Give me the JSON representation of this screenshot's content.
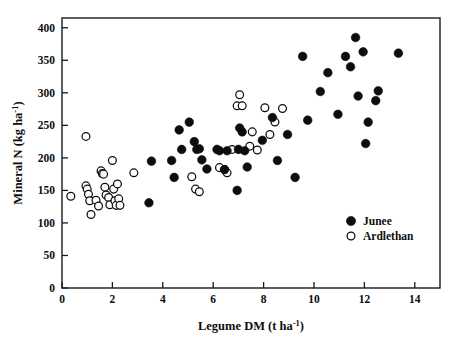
{
  "chart_data": {
    "type": "scatter",
    "title": "",
    "xlabel": "Legume DM (t ha-1)",
    "xlabel_main": "Legume DM (t ha",
    "xlabel_sup": "-1",
    "xlabel_tail": ")",
    "ylabel": "Mineral N (kg ha-1)",
    "ylabel_main": "Mineral N (kg ha",
    "ylabel_sup": "-1",
    "ylabel_tail": ")",
    "xlim": [
      0,
      15
    ],
    "ylim": [
      0,
      415
    ],
    "xticks": [
      0,
      2,
      4,
      6,
      8,
      10,
      12,
      14
    ],
    "yticks": [
      0,
      50,
      100,
      150,
      200,
      250,
      300,
      350,
      400
    ],
    "grid": false,
    "legend_position": "bottom-right",
    "marker_color": "#0d0d0d",
    "series": [
      {
        "name": "Junee",
        "marker": "filled-circle",
        "color": "#0d0d0d",
        "points": [
          [
            3.45,
            131
          ],
          [
            3.55,
            195
          ],
          [
            4.35,
            196
          ],
          [
            4.45,
            170
          ],
          [
            4.65,
            243
          ],
          [
            4.75,
            213
          ],
          [
            5.05,
            255
          ],
          [
            5.25,
            225
          ],
          [
            5.35,
            213
          ],
          [
            5.45,
            214
          ],
          [
            5.55,
            197
          ],
          [
            5.75,
            183
          ],
          [
            6.15,
            213
          ],
          [
            6.25,
            211
          ],
          [
            6.45,
            182
          ],
          [
            6.55,
            211
          ],
          [
            6.95,
            150
          ],
          [
            7.0,
            213
          ],
          [
            7.05,
            246
          ],
          [
            7.15,
            240
          ],
          [
            7.25,
            211
          ],
          [
            7.35,
            186
          ],
          [
            7.95,
            227
          ],
          [
            8.35,
            262
          ],
          [
            8.55,
            196
          ],
          [
            8.95,
            236
          ],
          [
            9.25,
            170
          ],
          [
            9.55,
            356
          ],
          [
            9.75,
            258
          ],
          [
            10.25,
            302
          ],
          [
            10.55,
            331
          ],
          [
            10.95,
            267
          ],
          [
            11.25,
            356
          ],
          [
            11.45,
            340
          ],
          [
            11.65,
            385
          ],
          [
            11.75,
            295
          ],
          [
            11.95,
            363
          ],
          [
            12.05,
            222
          ],
          [
            12.15,
            255
          ],
          [
            12.45,
            288
          ],
          [
            12.55,
            303
          ],
          [
            13.35,
            361
          ]
        ]
      },
      {
        "name": "Ardlethan",
        "marker": "open-circle",
        "color": "#0d0d0d",
        "points": [
          [
            0.35,
            141
          ],
          [
            0.95,
            233
          ],
          [
            0.95,
            157
          ],
          [
            1.0,
            152
          ],
          [
            1.05,
            144
          ],
          [
            1.1,
            134
          ],
          [
            1.15,
            113
          ],
          [
            1.35,
            135
          ],
          [
            1.45,
            126
          ],
          [
            1.55,
            180
          ],
          [
            1.6,
            176
          ],
          [
            1.65,
            175
          ],
          [
            1.7,
            155
          ],
          [
            1.75,
            143
          ],
          [
            1.85,
            139
          ],
          [
            1.9,
            128
          ],
          [
            2.0,
            196
          ],
          [
            2.05,
            152
          ],
          [
            2.1,
            134
          ],
          [
            2.15,
            127
          ],
          [
            2.2,
            160
          ],
          [
            2.25,
            137
          ],
          [
            2.3,
            127
          ],
          [
            2.85,
            177
          ],
          [
            5.15,
            171
          ],
          [
            5.3,
            152
          ],
          [
            5.45,
            148
          ],
          [
            6.25,
            185
          ],
          [
            6.45,
            182
          ],
          [
            6.55,
            177
          ],
          [
            6.75,
            213
          ],
          [
            6.95,
            280
          ],
          [
            7.05,
            297
          ],
          [
            7.15,
            280
          ],
          [
            7.45,
            218
          ],
          [
            7.55,
            240
          ],
          [
            7.75,
            212
          ],
          [
            8.05,
            277
          ],
          [
            8.25,
            236
          ],
          [
            8.45,
            255
          ],
          [
            8.75,
            276
          ]
        ]
      }
    ]
  }
}
